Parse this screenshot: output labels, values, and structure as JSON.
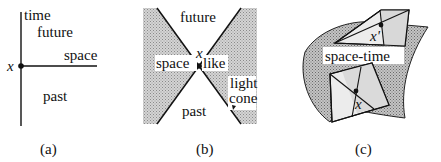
{
  "panels": {
    "a": {
      "caption": "(a)",
      "labels": {
        "time": "time",
        "future": "future",
        "space": "space",
        "past": "past",
        "point": "x"
      }
    },
    "b": {
      "caption": "(b)",
      "labels": {
        "future": "future",
        "space_left": "space",
        "space_right": "like",
        "past": "past",
        "point": "x",
        "light": "light",
        "cone": "cone"
      }
    },
    "c": {
      "caption": "(c)",
      "labels": {
        "spacetime": "space-time",
        "point_top": "x'",
        "point_bottom": "x"
      }
    }
  },
  "colors": {
    "ink": "#111111",
    "shade": "#b8b8b8",
    "light_shade": "#e6e6e6",
    "background": "#ffffff"
  }
}
